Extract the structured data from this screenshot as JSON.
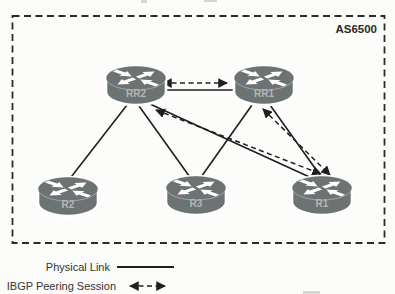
{
  "figure": {
    "as_label": "AS6500",
    "legend": {
      "physical": "Physical Link",
      "ibgp": "IBGP Peering Session"
    },
    "colors": {
      "router_fill": "#6d7373",
      "router_label": "#b2b8b8",
      "line": "#1f1f1f",
      "background": "#fcfcfb"
    },
    "diagram": {
      "nodes": [
        {
          "id": "RR2",
          "label": "RR2",
          "x": 106,
          "y": 66
        },
        {
          "id": "RR1",
          "label": "RR1",
          "x": 234,
          "y": 66
        },
        {
          "id": "R2",
          "label": "R2",
          "x": 38,
          "y": 177
        },
        {
          "id": "R3",
          "label": "R3",
          "x": 166,
          "y": 176
        },
        {
          "id": "R1",
          "label": "R1",
          "x": 292,
          "y": 176
        }
      ],
      "edges": [
        {
          "from": "RR2",
          "to": "RR1",
          "type": "physical",
          "x1": 164,
          "y1": 90,
          "x2": 233,
          "y2": 90
        },
        {
          "from": "RR2",
          "to": "R2",
          "type": "physical",
          "x1": 127,
          "y1": 105,
          "x2": 68,
          "y2": 181
        },
        {
          "from": "RR2",
          "to": "R3",
          "type": "physical",
          "x1": 139,
          "y1": 106,
          "x2": 192,
          "y2": 180
        },
        {
          "from": "RR2",
          "to": "R1",
          "type": "physical",
          "x1": 150,
          "y1": 104,
          "x2": 316,
          "y2": 180
        },
        {
          "from": "RR1",
          "to": "R3",
          "type": "physical",
          "x1": 252,
          "y1": 105,
          "x2": 199,
          "y2": 180
        },
        {
          "from": "RR1",
          "to": "R1",
          "type": "physical",
          "x1": 270,
          "y1": 105,
          "x2": 322,
          "y2": 178
        },
        {
          "from": "RR2",
          "to": "RR1",
          "type": "ibgp",
          "x1": 163,
          "y1": 83,
          "x2": 227,
          "y2": 83
        },
        {
          "from": "RR2",
          "to": "R1",
          "type": "ibgp",
          "x1": 156,
          "y1": 110,
          "x2": 321,
          "y2": 174
        },
        {
          "from": "RR1",
          "to": "R1",
          "type": "ibgp",
          "x1": 263,
          "y1": 109,
          "x2": 330,
          "y2": 175
        }
      ]
    }
  }
}
